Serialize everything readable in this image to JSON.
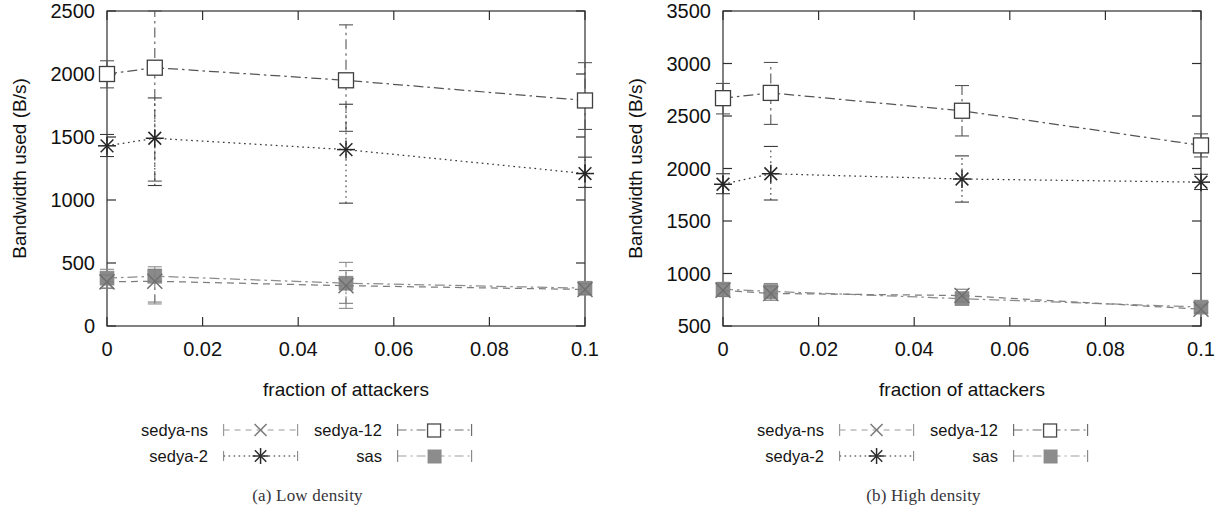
{
  "figure": {
    "subfigures": [
      {
        "id": "a",
        "caption": "(a) Low density",
        "chart_ref": 0
      },
      {
        "id": "b",
        "caption": "(b) High density",
        "chart_ref": 1
      }
    ]
  },
  "legend": {
    "entries": [
      {
        "label": "sedya-ns",
        "marker": "cross-x-icon",
        "line": "dashed",
        "color": "#7d7d7d"
      },
      {
        "label": "sedya-12",
        "marker": "open-square-icon",
        "line": "dash-dot",
        "color": "#555555"
      },
      {
        "label": "sedya-2",
        "marker": "asterisk-icon",
        "line": "dotted",
        "color": "#3a3a3a"
      },
      {
        "label": "sas",
        "marker": "filled-square-icon",
        "line": "dash-dot",
        "color": "#8c8c8c"
      }
    ]
  },
  "chart_data": [
    {
      "type": "line",
      "title": "(a) Low density",
      "xlabel": "fraction of attackers",
      "ylabel": "Bandwidth used (B/s)",
      "x": [
        0,
        0.01,
        0.05,
        0.1
      ],
      "xlim": [
        0,
        0.1
      ],
      "ylim": [
        0,
        2500
      ],
      "xticks": [
        0,
        0.02,
        0.04,
        0.06,
        0.08,
        0.1
      ],
      "xticklabels": [
        "0",
        "0.02",
        "0.04",
        "0.06",
        "0.08",
        "0.1"
      ],
      "yticks": [
        0,
        500,
        1000,
        1500,
        2000,
        2500
      ],
      "yticklabels": [
        "0",
        "500",
        "1000",
        "1500",
        "2000",
        "2500"
      ],
      "grid": false,
      "legend_position": "below",
      "series": [
        {
          "name": "sedya-12",
          "values": [
            2000,
            2050,
            1950,
            1790
          ],
          "err_low": [
            1890,
            1150,
            1545,
            1560
          ],
          "err_high": [
            2105,
            2560,
            2390,
            2090
          ],
          "marker": "open-square",
          "line": "dash-dot",
          "color": "#555555"
        },
        {
          "name": "sedya-2",
          "values": [
            1430,
            1490,
            1400,
            1210
          ],
          "err_low": [
            1345,
            1115,
            975,
            1100
          ],
          "err_high": [
            1520,
            1810,
            1760,
            1340
          ],
          "marker": "asterisk",
          "line": "dotted",
          "color": "#3a3a3a"
        },
        {
          "name": "sas",
          "values": [
            380,
            395,
            340,
            300
          ],
          "err_low": [
            300,
            175,
            140,
            250
          ],
          "err_high": [
            450,
            470,
            505,
            350
          ],
          "marker": "filled-square",
          "line": "dash-dot",
          "color": "#8c8c8c"
        },
        {
          "name": "sedya-ns",
          "values": [
            350,
            355,
            320,
            290
          ],
          "err_low": [
            300,
            190,
            180,
            250
          ],
          "err_high": [
            405,
            450,
            440,
            335
          ],
          "marker": "cross-x",
          "line": "dashed",
          "color": "#7d7d7d"
        }
      ]
    },
    {
      "type": "line",
      "title": "(b) High density",
      "xlabel": "fraction of attackers",
      "ylabel": "Bandwidth used (B/s)",
      "x": [
        0,
        0.01,
        0.05,
        0.1
      ],
      "xlim": [
        0,
        0.1
      ],
      "ylim": [
        500,
        3500
      ],
      "xticks": [
        0,
        0.02,
        0.04,
        0.06,
        0.08,
        0.1
      ],
      "xticklabels": [
        "0",
        "0.02",
        "0.04",
        "0.06",
        "0.08",
        "0.1"
      ],
      "yticks": [
        500,
        1000,
        1500,
        2000,
        2500,
        3000,
        3500
      ],
      "yticklabels": [
        "500",
        "1000",
        "1500",
        "2000",
        "2500",
        "3000",
        "3500"
      ],
      "grid": false,
      "legend_position": "below",
      "series": [
        {
          "name": "sedya-12",
          "values": [
            2670,
            2720,
            2550,
            2220
          ],
          "err_low": [
            2520,
            2420,
            2310,
            2110
          ],
          "err_high": [
            2810,
            3010,
            2790,
            2330
          ],
          "marker": "open-square",
          "line": "dash-dot",
          "color": "#555555"
        },
        {
          "name": "sedya-2",
          "values": [
            1850,
            1950,
            1900,
            1870
          ],
          "err_low": [
            1760,
            1700,
            1680,
            1800
          ],
          "err_high": [
            1950,
            2210,
            2120,
            1945
          ],
          "marker": "asterisk",
          "line": "dotted",
          "color": "#3a3a3a"
        },
        {
          "name": "sas",
          "values": [
            850,
            830,
            760,
            680
          ],
          "err_low": [
            790,
            760,
            700,
            640
          ],
          "err_high": [
            915,
            905,
            820,
            720
          ],
          "marker": "filled-square",
          "line": "dash-dot",
          "color": "#8c8c8c"
        },
        {
          "name": "sedya-ns",
          "values": [
            840,
            810,
            790,
            660
          ],
          "err_low": [
            780,
            745,
            730,
            625
          ],
          "err_high": [
            900,
            880,
            850,
            700
          ],
          "marker": "cross-x",
          "line": "dashed",
          "color": "#7d7d7d"
        }
      ]
    }
  ]
}
